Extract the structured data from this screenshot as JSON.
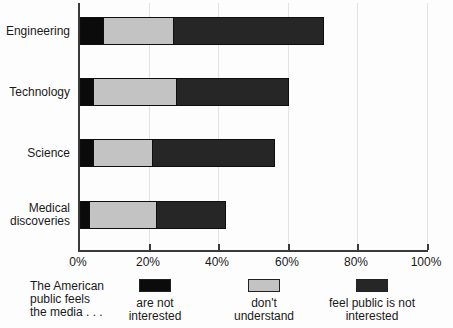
{
  "chart_data": {
    "type": "bar",
    "orientation": "horizontal",
    "stacked": true,
    "title": "",
    "categories": [
      "Engineering",
      "Technology",
      "Science",
      "Medical discoveries"
    ],
    "series": [
      {
        "name": "are not interested",
        "color": "#0b0b0b",
        "values": [
          7,
          4,
          4,
          3
        ]
      },
      {
        "name": "don't understand",
        "color": "#c3c3c3",
        "values": [
          20,
          24,
          17,
          19
        ]
      },
      {
        "name": "feel public is not interested",
        "color": "#262626",
        "values": [
          43,
          32,
          35,
          20
        ]
      }
    ],
    "totals": [
      70,
      60,
      56,
      42
    ],
    "xlim": [
      0,
      100
    ],
    "xticks": [
      {
        "label": "0%",
        "value": 0
      },
      {
        "label": "20%",
        "value": 20
      },
      {
        "label": "40%",
        "value": 40
      },
      {
        "label": "60%",
        "value": 60
      },
      {
        "label": "80%",
        "value": 80
      },
      {
        "label": "100%",
        "value": 100
      }
    ],
    "grid": "faint-vertical-at-ticks",
    "legend_position": "bottom",
    "legend_intro_lines": [
      "The American",
      "public feels",
      "the media . . ."
    ]
  }
}
